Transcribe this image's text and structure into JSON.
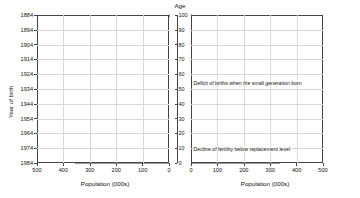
{
  "chart_data": {
    "type": "bar",
    "subtype": "population-pyramid",
    "title": "",
    "center_axis_label": "Age",
    "ylabel": "Year of birth",
    "xlabel_left": "Population (000s)",
    "xlabel_right": "Population (000s)",
    "panels": [
      {
        "name": "male",
        "label": "Male",
        "side": "left"
      },
      {
        "name": "female",
        "label": "Female",
        "side": "right"
      }
    ],
    "xlim_left": [
      500,
      0
    ],
    "xlim_right": [
      0,
      500
    ],
    "x_ticks_left": [
      500,
      400,
      300,
      200,
      100,
      0
    ],
    "x_ticks_right": [
      0,
      100,
      200,
      300,
      400,
      500
    ],
    "age_axis": {
      "label": "Age",
      "min": 0,
      "max": 100,
      "ticks": [
        0,
        10,
        20,
        30,
        40,
        50,
        60,
        70,
        80,
        90,
        100
      ]
    },
    "year_axis": {
      "label": "Year of birth",
      "ticks": [
        1884,
        1894,
        1904,
        1914,
        1924,
        1934,
        1944,
        1954,
        1964,
        1974,
        1984
      ]
    },
    "grid": true,
    "legend_position": "none",
    "units": "thousands",
    "bar_color": "#dadada",
    "series": [
      {
        "name": "Male",
        "side": "left",
        "ages": [
          0,
          1,
          2,
          3,
          4,
          5,
          6,
          7,
          8,
          9,
          10,
          11,
          12,
          13,
          14,
          15,
          16,
          17,
          18,
          19,
          20,
          21,
          22,
          23,
          24,
          25,
          26,
          27,
          28,
          29,
          30,
          31,
          32,
          33,
          34,
          35,
          36,
          37,
          38,
          39,
          40,
          41,
          42,
          43,
          44,
          45,
          46,
          47,
          48,
          49,
          50,
          51,
          52,
          53,
          54,
          55,
          56,
          57,
          58,
          59,
          60,
          61,
          62,
          63,
          64,
          65,
          66,
          67,
          68,
          69,
          70,
          71,
          72,
          73,
          74,
          75,
          76,
          77,
          78,
          79,
          80,
          81,
          82,
          83,
          84,
          85,
          86,
          87,
          88,
          89,
          90,
          91,
          92,
          93,
          94,
          95,
          96,
          97,
          98,
          99,
          100
        ],
        "values": [
          355,
          358,
          360,
          362,
          364,
          366,
          368,
          370,
          372,
          374,
          376,
          378,
          380,
          382,
          384,
          392,
          398,
          404,
          410,
          414,
          418,
          420,
          422,
          424,
          426,
          430,
          434,
          438,
          442,
          446,
          450,
          452,
          448,
          444,
          440,
          436,
          432,
          428,
          424,
          420,
          416,
          412,
          408,
          404,
          400,
          398,
          400,
          404,
          410,
          416,
          424,
          430,
          436,
          442,
          448,
          452,
          448,
          440,
          430,
          420,
          410,
          400,
          392,
          386,
          380,
          374,
          368,
          362,
          356,
          350,
          344,
          338,
          330,
          320,
          308,
          294,
          280,
          264,
          248,
          232,
          216,
          198,
          180,
          160,
          140,
          120,
          100,
          82,
          66,
          52,
          40,
          30,
          22,
          16,
          11,
          8,
          5,
          3,
          2,
          1,
          1
        ]
      },
      {
        "name": "Female",
        "side": "right",
        "ages": [
          0,
          1,
          2,
          3,
          4,
          5,
          6,
          7,
          8,
          9,
          10,
          11,
          12,
          13,
          14,
          15,
          16,
          17,
          18,
          19,
          20,
          21,
          22,
          23,
          24,
          25,
          26,
          27,
          28,
          29,
          30,
          31,
          32,
          33,
          34,
          35,
          36,
          37,
          38,
          39,
          40,
          41,
          42,
          43,
          44,
          45,
          46,
          47,
          48,
          49,
          50,
          51,
          52,
          53,
          54,
          55,
          56,
          57,
          58,
          59,
          60,
          61,
          62,
          63,
          64,
          65,
          66,
          67,
          68,
          69,
          70,
          71,
          72,
          73,
          74,
          75,
          76,
          77,
          78,
          79,
          80,
          81,
          82,
          83,
          84,
          85,
          86,
          87,
          88,
          89,
          90,
          91,
          92,
          93,
          94,
          95,
          96,
          97,
          98,
          99,
          100
        ],
        "values": [
          338,
          341,
          343,
          345,
          347,
          349,
          351,
          353,
          355,
          357,
          359,
          361,
          363,
          365,
          367,
          374,
          380,
          386,
          391,
          395,
          399,
          401,
          403,
          405,
          407,
          411,
          415,
          419,
          423,
          427,
          431,
          433,
          429,
          425,
          421,
          417,
          413,
          409,
          405,
          401,
          397,
          393,
          389,
          385,
          381,
          379,
          381,
          385,
          391,
          397,
          405,
          411,
          417,
          423,
          429,
          433,
          430,
          423,
          414,
          405,
          396,
          387,
          380,
          375,
          370,
          365,
          360,
          356,
          352,
          348,
          344,
          340,
          334,
          326,
          316,
          304,
          292,
          278,
          264,
          250,
          236,
          220,
          202,
          184,
          164,
          144,
          124,
          104,
          86,
          70,
          55,
          42,
          32,
          24,
          17,
          12,
          8,
          5,
          3,
          2,
          1
        ]
      }
    ],
    "annotations": [
      {
        "text": "Deficit of births due to 1914–18 war",
        "age": 66,
        "align": "right"
      },
      {
        "text": "Deficit of births when the small generation born",
        "age": 54,
        "align": "left"
      },
      {
        "text": "Deficit of births due to 1939–45 war",
        "age": 43,
        "align": "right"
      },
      {
        "text": "Baby boom after WW2",
        "age": 36,
        "align": "right"
      },
      {
        "text": "Decline of fertility below replacement level",
        "age": 9,
        "align": "left"
      }
    ]
  }
}
